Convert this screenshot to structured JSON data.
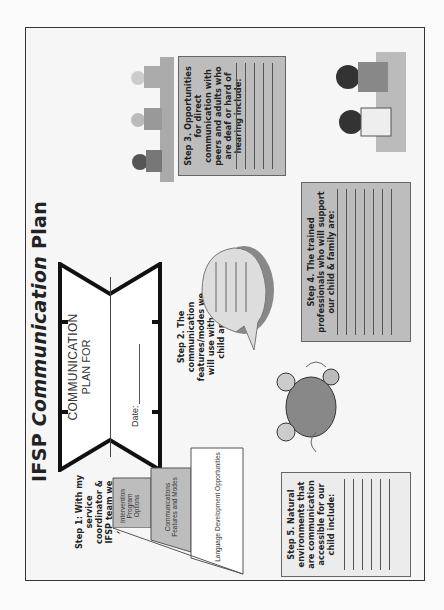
{
  "title": {
    "prefix": "IFSP ",
    "emphasis": "Communication",
    "suffix": " Plan"
  },
  "banner": {
    "line1": "COMMUNICATION",
    "line2": "PLAN FOR",
    "date_label": "Date:"
  },
  "step1": {
    "text": "Step 1: With my service coordinator & IFSP team we evaluate:",
    "pyramid": [
      "Intervention Program Options",
      "Communications Features and Modes",
      "Language Development Opportunities"
    ]
  },
  "step2": {
    "text": "Step 2. The communication features/modes we will use with our child are:",
    "line_count": 4
  },
  "step3": {
    "text": "Step 3. Opportunities for direct communication with peers and adults who are deaf or hard of hearing include:",
    "line_count": 5
  },
  "step4": {
    "text": "Step 4. The trained professionals who will support our child & family are:",
    "line_count": 7
  },
  "step5": {
    "text": "Step 5. Natural environments that are communication accessible for our child include:",
    "line_count": 6
  },
  "colors": {
    "box_fill": "#bdbdbd",
    "frame": "#333333",
    "background": "#f6f6f6"
  }
}
